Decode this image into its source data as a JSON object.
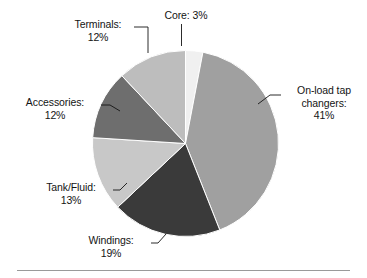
{
  "figure": {
    "background_color": "#ffffff",
    "rule_color": "#9a9a9a"
  },
  "chart_data": {
    "type": "pie",
    "title": "",
    "subtitle": "",
    "xlabel": "",
    "ylabel": "",
    "legend_position": "none",
    "grid": false,
    "label_format": "{name}: {value}%",
    "start_angle_deg": 0,
    "direction": "clockwise",
    "center": {
      "x": 185.5,
      "y": 143.5
    },
    "radius": 93,
    "categories": [
      "Core",
      "On-load tap changers",
      "Windings",
      "Tank/Fluid",
      "Accessories",
      "Terminals"
    ],
    "values": [
      3,
      41,
      19,
      13,
      12,
      12
    ],
    "colors": [
      "#f0f0f0",
      "#a0a0a0",
      "#3a3a3a",
      "#c8c8c8",
      "#6e6e6e",
      "#bdbdbd"
    ],
    "slices": [
      {
        "name": "Core",
        "value": 3,
        "label_lines": [
          "Core: 3%"
        ],
        "color": "#f0f0f0"
      },
      {
        "name": "On-load tap changers",
        "value": 41,
        "label_lines": [
          "On-load tap",
          "changers:",
          "41%"
        ],
        "color": "#a0a0a0"
      },
      {
        "name": "Windings",
        "value": 19,
        "label_lines": [
          "Windings:",
          "19%"
        ],
        "color": "#3a3a3a"
      },
      {
        "name": "Tank/Fluid",
        "value": 13,
        "label_lines": [
          "Tank/Fluid:",
          "13%"
        ],
        "color": "#c8c8c8"
      },
      {
        "name": "Accessories",
        "value": 12,
        "label_lines": [
          "Accessories:",
          "12%"
        ],
        "color": "#6e6e6e"
      },
      {
        "name": "Terminals",
        "value": 12,
        "label_lines": [
          "Terminals:",
          "12%"
        ],
        "color": "#bdbdbd"
      }
    ]
  },
  "labels": {
    "core": {
      "line1": "Core: 3%"
    },
    "tap_changers": {
      "line1": "On-load tap",
      "line2": "changers:",
      "line3": "41%"
    },
    "windings": {
      "line1": "Windings:",
      "line2": "19%"
    },
    "tank_fluid": {
      "line1": "Tank/Fluid:",
      "line2": "13%"
    },
    "accessories": {
      "line1": "Accessories:",
      "line2": "12%"
    },
    "terminals": {
      "line1": "Terminals:",
      "line2": "12%"
    }
  }
}
